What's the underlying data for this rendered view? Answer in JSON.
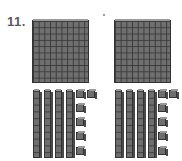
{
  "problem": {
    "number_label": "11."
  },
  "groups": [
    {
      "name": "left",
      "hundreds": 1,
      "tens": 4,
      "ones": 6
    },
    {
      "name": "right",
      "hundreds": 1,
      "tens": 4,
      "ones": 6
    }
  ],
  "totals": {
    "hundreds": 2,
    "tens": 8,
    "ones": 12
  },
  "colors": {
    "block_fill": "#6f6f6f",
    "grid_line": "#3b3b3b",
    "label": "#5a5a5a"
  }
}
